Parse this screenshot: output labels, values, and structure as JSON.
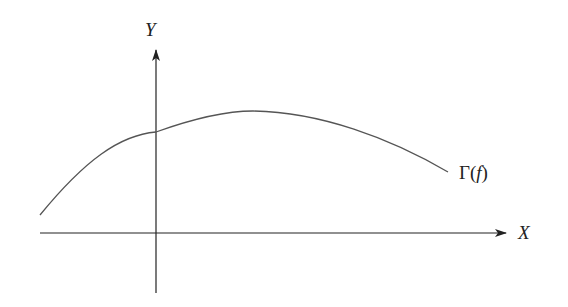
{
  "diagram": {
    "title": "",
    "axes": {
      "x": {
        "label": "X",
        "from": [
          40,
          233
        ],
        "to": [
          506,
          233
        ]
      },
      "y": {
        "label": "Y",
        "from": [
          156,
          293
        ],
        "to": [
          156,
          50
        ]
      }
    },
    "curve": {
      "label_prefix": "Γ(",
      "label_var": "f",
      "label_suffix": ")",
      "path": "M 40 215 C 85 160, 130 130, 175 125 C 205 112, 230 110, 253 111 C 320 112, 390 135, 448 172",
      "stroke": "#555555"
    },
    "colors": {
      "axis": "#222222",
      "curve": "#555555",
      "background": "#ffffff"
    }
  }
}
